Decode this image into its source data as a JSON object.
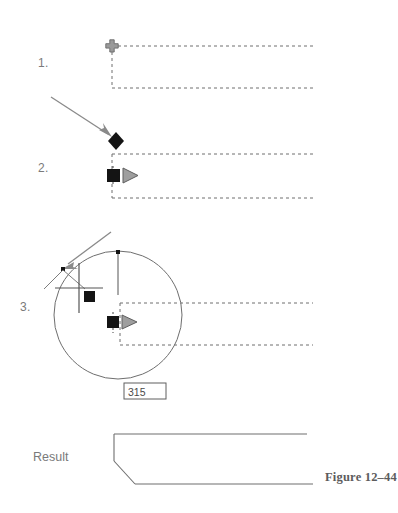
{
  "figure": {
    "caption": "Figure 12–44",
    "result_label": "Result",
    "background_color": "#ffffff",
    "line_color": "#6e6e6e",
    "marker_color": "#141414",
    "cursor_color": "#8c8c8c",
    "text_color": "#7a7a7a"
  },
  "steps": [
    {
      "number": "1.",
      "description": "Pick the first line of the corner",
      "marker": "snap-cross-icon",
      "marker_color": "#8a8a8a"
    },
    {
      "number": "2.",
      "description": "Pick the second line of the corner",
      "marker": "diamond-marker-icon",
      "secondary_marker": "square-marker-icon",
      "cursor": "pickbox-cursor-icon",
      "marker_color": "#141414"
    },
    {
      "number": "3.",
      "description": "Specify the fillet radius",
      "marker": "square-marker-icon",
      "cursor": "crosshair-cursor-icon",
      "input_value": "315",
      "marker_color": "#141414"
    }
  ],
  "annotations": {
    "pointer_arrow_1": "arrow-annotation",
    "pointer_arrow_2": "arrow-annotation",
    "radius_value": "315"
  },
  "geometry": {
    "step1": {
      "open_rect": "M 112,46 L 313,46 M 112,46 L 112,88 M 112,88 L 313,88",
      "snap_point": {
        "x": 112,
        "y": 46
      }
    },
    "step2": {
      "open_rect": "M 112,154 L 313,154 M 112,154 L 112,198 M 112,198 L 313,198",
      "diamond_point": {
        "x": 116,
        "y": 141
      },
      "square_point": {
        "x": 113,
        "y": 175
      },
      "arrow": {
        "x1": 52,
        "y1": 98,
        "x2": 112,
        "y2": 137
      }
    },
    "step3": {
      "open_rect": "M 120,303 L 313,303 M 120,303 L 120,345 M 120,345 L 313,345",
      "circle": {
        "cx": 118,
        "cy": 315,
        "r": 64
      },
      "radius_line": {
        "x1": 118,
        "y1": 251,
        "x2": 118,
        "y2": 295
      },
      "crosshair": {
        "cx": 78,
        "cy": 281,
        "size": 26
      },
      "square_point": {
        "x": 88,
        "y": 294
      },
      "cursor_point": {
        "x": 113,
        "y": 322
      },
      "arrow": {
        "x1": 110,
        "y1": 233,
        "x2": 62,
        "y2": 268
      },
      "value_box": {
        "x": 124,
        "y": 383,
        "w": 41,
        "h": 16
      }
    },
    "result": {
      "path": "M 114,434 L 307,434 M 114,434 L 114,461 M 114,461 L 135,484 M 135,484 L 313,484"
    }
  }
}
